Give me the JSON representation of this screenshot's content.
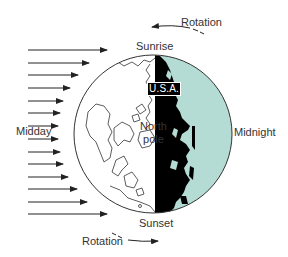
{
  "diagram": {
    "labels": {
      "rotation_top": "Rotation",
      "rotation_bottom": "Rotation",
      "sunrise": "Sunrise",
      "sunset": "Sunset",
      "midday": "Midday",
      "midnight": "Midnight",
      "usa": "U.S.A.",
      "north_pole_line1": "North",
      "north_pole_line2": "pole"
    },
    "colors": {
      "night_side": "#b5dcd4",
      "landmass_night": "#000000",
      "outline": "#333333",
      "day_side": "#ffffff"
    },
    "sunlight_arrows": {
      "count": 14,
      "direction": "left-to-right",
      "start_x": 28,
      "rows": [
        {
          "y": 50,
          "end_x": 107
        },
        {
          "y": 63,
          "end_x": 89
        },
        {
          "y": 75,
          "end_x": 78
        },
        {
          "y": 88,
          "end_x": 70
        },
        {
          "y": 101,
          "end_x": 63
        },
        {
          "y": 113,
          "end_x": 60
        },
        {
          "y": 126,
          "end_x": 58
        },
        {
          "y": 139,
          "end_x": 58
        },
        {
          "y": 152,
          "end_x": 60
        },
        {
          "y": 164,
          "end_x": 63
        },
        {
          "y": 177,
          "end_x": 68
        },
        {
          "y": 189,
          "end_x": 77
        },
        {
          "y": 202,
          "end_x": 87
        },
        {
          "y": 214,
          "end_x": 107
        }
      ]
    },
    "globe": {
      "cx": 153,
      "cy": 134,
      "r": 79,
      "terminator_x": 155
    }
  }
}
